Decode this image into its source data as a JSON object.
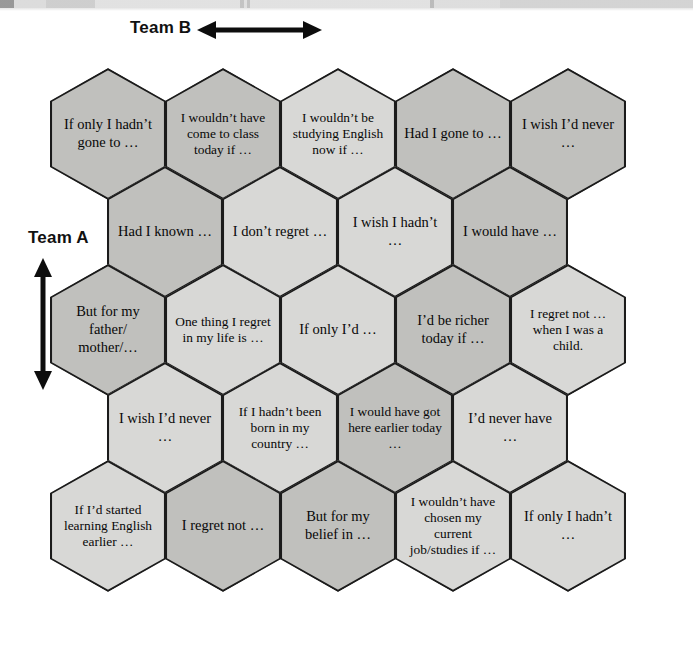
{
  "teams": {
    "team_b_label": "Team B",
    "team_a_label": "Team A",
    "team_b_arrow_icon": "horizontal-double-arrow-icon",
    "team_a_arrow_icon": "vertical-double-arrow-icon"
  },
  "board": {
    "colors": {
      "hex_light": "#d8d8d6",
      "hex_dark": "#c0c0bd",
      "hex_border": "#1b1b1b",
      "page_background": "#ffffff",
      "text": "#080808"
    },
    "rows": [
      {
        "index": 0,
        "cells": [
          {
            "text": "If only I hadn’t gone to …",
            "shade": "dark"
          },
          {
            "text": "I wouldn’t have come to class today if …",
            "shade": "dark"
          },
          {
            "text": "I wouldn’t be studying English now if …",
            "shade": "light"
          },
          {
            "text": "Had I gone to …",
            "shade": "dark"
          },
          {
            "text": "I wish I’d never …",
            "shade": "dark"
          }
        ]
      },
      {
        "index": 1,
        "cells": [
          {
            "text": "Had I known …",
            "shade": "dark"
          },
          {
            "text": "I don’t regret …",
            "shade": "light"
          },
          {
            "text": "I wish I hadn’t …",
            "shade": "light"
          },
          {
            "text": "I would have …",
            "shade": "dark"
          }
        ]
      },
      {
        "index": 2,
        "cells": [
          {
            "text": "But for my father/ mother/…",
            "shade": "dark"
          },
          {
            "text": "One thing I regret in my life is …",
            "shade": "light"
          },
          {
            "text": "If only I’d …",
            "shade": "light"
          },
          {
            "text": "I’d be richer today if …",
            "shade": "dark"
          },
          {
            "text": "I regret not … when I was a child.",
            "shade": "light"
          }
        ]
      },
      {
        "index": 3,
        "cells": [
          {
            "text": "I wish I’d never …",
            "shade": "light"
          },
          {
            "text": "If I hadn’t been born in my country …",
            "shade": "light"
          },
          {
            "text": "I would have got here earlier today …",
            "shade": "dark"
          },
          {
            "text": "I’d never have …",
            "shade": "light"
          }
        ]
      },
      {
        "index": 4,
        "cells": [
          {
            "text": "If I’d started learning English earlier …",
            "shade": "light"
          },
          {
            "text": "I regret not …",
            "shade": "dark"
          },
          {
            "text": "But for my belief in …",
            "shade": "dark"
          },
          {
            "text": "I wouldn’t have chosen my current job/studies if …",
            "shade": "light"
          },
          {
            "text": "If only I hadn’t …",
            "shade": "light"
          }
        ]
      }
    ]
  }
}
